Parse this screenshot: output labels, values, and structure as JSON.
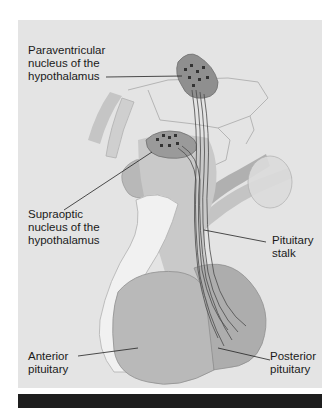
{
  "figure": {
    "labels": {
      "paraventricular": [
        "Paraventricular",
        "nucleus of the",
        "hypothalamus"
      ],
      "supraoptic": [
        "Supraoptic",
        "nucleus of the",
        "hypothalamus"
      ],
      "stalk": [
        "Pituitary",
        "stalk"
      ],
      "anterior": [
        "Anterior",
        "pituitary"
      ],
      "posterior": [
        "Posterior",
        "pituitary"
      ]
    },
    "colors": {
      "background": "#e4e4e4",
      "tissue_light": "#d6d6d6",
      "tissue_mid": "#bdbdbd",
      "tissue_dark": "#9c9c9c",
      "nucleus": "#8a8a8a",
      "neuron_dots": "#3a3a3a",
      "leader_line": "#222222",
      "bottom_bar": "#1e1e1e"
    }
  }
}
